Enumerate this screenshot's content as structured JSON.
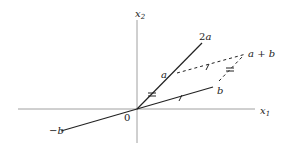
{
  "diagram": {
    "type": "vector-addition-parallelogram",
    "axes": {
      "x_label": "x",
      "x_subscript": "1",
      "y_label": "x",
      "y_subscript": "2",
      "origin_label": "0"
    },
    "vectors": [
      {
        "id": "2a",
        "label": "2a",
        "style": "solid"
      },
      {
        "id": "a",
        "label": "a",
        "style": "point-on-2a"
      },
      {
        "id": "b",
        "label": "b",
        "style": "solid"
      },
      {
        "id": "neg-b",
        "label": "−b",
        "style": "solid"
      },
      {
        "id": "a-plus-b",
        "label": "a + b",
        "style": "dashed-parallelogram"
      }
    ],
    "tick_marks": {
      "single": "equal length marks on b and the dashed side parallel to b",
      "double": "equal length marks on a and the dashed side parallel to a"
    },
    "colors": {
      "line": "#222222",
      "axis": "#888888",
      "background": "#ffffff"
    }
  }
}
